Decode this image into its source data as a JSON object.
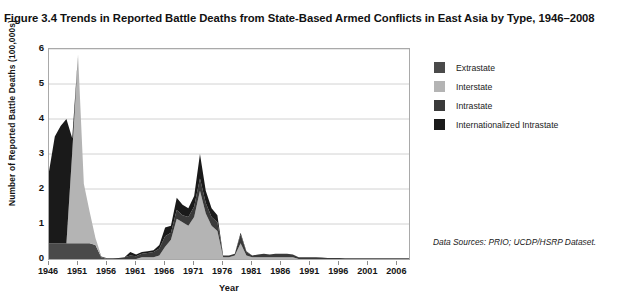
{
  "figure": {
    "title": "Figure 3.4 Trends in Reported Battle Deaths from State-Based Armed Conflicts in East Asia by Type, 1946–2008",
    "source_note": "Data Sources: PRIO; UCDP/HSRP Dataset."
  },
  "legend": {
    "items": [
      {
        "label": "Extrastate",
        "color": "#4a4a4a"
      },
      {
        "label": "Interstate",
        "color": "#b4b4b4"
      },
      {
        "label": "Intrastate",
        "color": "#3a3a3a"
      },
      {
        "label": "Internationalized Intrastate",
        "color": "#1a1a1a"
      }
    ]
  },
  "chart_data": {
    "type": "area",
    "stacked": true,
    "title": "Figure 3.4 Trends in Reported Battle Deaths from State-Based Armed Conflicts in East Asia by Type, 1946–2008",
    "xlabel": "Year",
    "ylabel": "Number of Reported Battle Deaths (100,000s)",
    "xlim": [
      1946,
      2008
    ],
    "ylim": [
      0,
      6
    ],
    "yticks": [
      0,
      1,
      2,
      3,
      4,
      5,
      6
    ],
    "xticks": [
      1946,
      1951,
      1956,
      1961,
      1966,
      1971,
      1976,
      1981,
      1986,
      1991,
      1996,
      2001,
      2006
    ],
    "grid": "horizontal",
    "legend_position": "right",
    "x": [
      1946,
      1947,
      1948,
      1949,
      1950,
      1951,
      1952,
      1953,
      1954,
      1955,
      1956,
      1957,
      1958,
      1959,
      1960,
      1961,
      1962,
      1963,
      1964,
      1965,
      1966,
      1967,
      1968,
      1969,
      1970,
      1971,
      1972,
      1973,
      1974,
      1975,
      1976,
      1977,
      1978,
      1979,
      1980,
      1981,
      1982,
      1983,
      1984,
      1985,
      1986,
      1987,
      1988,
      1989,
      1990,
      1991,
      1992,
      1993,
      1994,
      1995,
      1996,
      1997,
      1998,
      1999,
      2000,
      2001,
      2002,
      2003,
      2004,
      2005,
      2006,
      2007,
      2008
    ],
    "series": [
      {
        "name": "Extrastate",
        "color": "#4a4a4a",
        "values": [
          0.45,
          0.45,
          0.45,
          0.45,
          0.45,
          0.45,
          0.45,
          0.45,
          0.4,
          0.05,
          0.0,
          0.0,
          0.0,
          0.0,
          0.0,
          0.0,
          0.0,
          0.0,
          0.0,
          0.0,
          0.0,
          0.0,
          0.0,
          0.0,
          0.0,
          0.0,
          0.0,
          0.0,
          0.0,
          0.0,
          0.0,
          0.0,
          0.0,
          0.0,
          0.0,
          0.0,
          0.0,
          0.0,
          0.0,
          0.0,
          0.0,
          0.0,
          0.0,
          0.0,
          0.0,
          0.0,
          0.0,
          0.0,
          0.0,
          0.0,
          0.0,
          0.0,
          0.0,
          0.0,
          0.0,
          0.0,
          0.0,
          0.0,
          0.0,
          0.0,
          0.0,
          0.0,
          0.0
        ]
      },
      {
        "name": "Interstate",
        "color": "#b4b4b4",
        "values": [
          0.0,
          0.0,
          0.0,
          0.0,
          2.6,
          5.4,
          1.7,
          0.9,
          0.2,
          0.0,
          0.0,
          0.0,
          0.0,
          0.0,
          0.0,
          0.0,
          0.05,
          0.05,
          0.05,
          0.1,
          0.35,
          0.55,
          1.15,
          1.05,
          0.95,
          1.2,
          1.95,
          1.3,
          0.95,
          0.8,
          0.05,
          0.05,
          0.1,
          0.45,
          0.1,
          0.05,
          0.05,
          0.05,
          0.05,
          0.05,
          0.05,
          0.05,
          0.05,
          0.0,
          0.0,
          0.0,
          0.0,
          0.0,
          0.0,
          0.0,
          0.0,
          0.0,
          0.0,
          0.0,
          0.0,
          0.0,
          0.0,
          0.0,
          0.0,
          0.0,
          0.0,
          0.0,
          0.0
        ]
      },
      {
        "name": "Intrastate",
        "color": "#3a3a3a",
        "values": [
          0.0,
          0.0,
          0.0,
          0.0,
          0.0,
          0.0,
          0.0,
          0.0,
          0.0,
          0.02,
          0.02,
          0.02,
          0.03,
          0.05,
          0.1,
          0.08,
          0.1,
          0.12,
          0.15,
          0.2,
          0.3,
          0.2,
          0.25,
          0.2,
          0.25,
          0.3,
          0.35,
          0.3,
          0.25,
          0.25,
          0.05,
          0.05,
          0.05,
          0.25,
          0.1,
          0.05,
          0.08,
          0.1,
          0.08,
          0.1,
          0.1,
          0.1,
          0.08,
          0.05,
          0.05,
          0.05,
          0.05,
          0.04,
          0.03,
          0.03,
          0.03,
          0.02,
          0.02,
          0.02,
          0.02,
          0.02,
          0.02,
          0.02,
          0.02,
          0.02,
          0.02,
          0.02,
          0.02
        ]
      },
      {
        "name": "Internationalized Intrastate",
        "color": "#1a1a1a",
        "values": [
          2.05,
          3.05,
          3.35,
          3.55,
          0.4,
          0.0,
          0.0,
          0.0,
          0.0,
          0.0,
          0.0,
          0.0,
          0.0,
          0.0,
          0.1,
          0.05,
          0.05,
          0.05,
          0.05,
          0.1,
          0.25,
          0.2,
          0.35,
          0.3,
          0.25,
          0.3,
          0.7,
          0.35,
          0.25,
          0.2,
          0.0,
          0.0,
          0.0,
          0.05,
          0.02,
          0.0,
          0.0,
          0.0,
          0.0,
          0.0,
          0.0,
          0.0,
          0.0,
          0.0,
          0.0,
          0.0,
          0.0,
          0.0,
          0.0,
          0.0,
          0.0,
          0.0,
          0.0,
          0.0,
          0.0,
          0.0,
          0.0,
          0.0,
          0.0,
          0.0,
          0.0,
          0.0,
          0.0
        ]
      }
    ]
  }
}
